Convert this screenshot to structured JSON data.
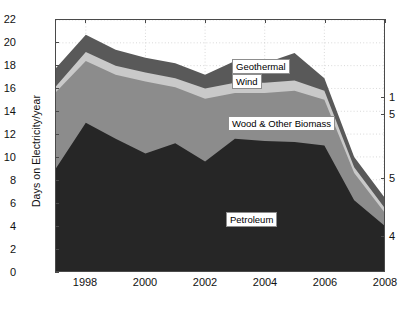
{
  "chart_data": {
    "type": "area",
    "stacked": true,
    "title": "",
    "subtitle": "",
    "xlabel": "",
    "ylabel": "Days on Electricity/year",
    "x": [
      1997,
      1998,
      1999,
      2000,
      2001,
      2002,
      2003,
      2004,
      2005,
      2006,
      2007,
      2008
    ],
    "xlim": [
      1997,
      2008
    ],
    "ylim": [
      0,
      22
    ],
    "ytick_labels": [
      "0",
      "2",
      "4",
      "6",
      "8",
      "10",
      "12",
      "14",
      "16",
      "18",
      "20",
      "22"
    ],
    "ytick_values": [
      0,
      2,
      4,
      6,
      8,
      10,
      12,
      14,
      16,
      18,
      20,
      22
    ],
    "xtick_labels": [
      "1998",
      "2000",
      "2002",
      "2004",
      "2006",
      "2008"
    ],
    "xtick_values": [
      1998,
      2000,
      2002,
      2004,
      2006,
      2008
    ],
    "grid": true,
    "grid_style": "dotted",
    "legend_position": "inline-labels",
    "series": [
      {
        "name": "Petroleum",
        "color": "#262626",
        "values": [
          9.0,
          13.0,
          11.6,
          10.3,
          11.2,
          9.6,
          11.6,
          11.4,
          11.3,
          11.0,
          6.2,
          4.0
        ]
      },
      {
        "name": "Wood & Other Biomass",
        "color": "#8c8c8c",
        "values": [
          6.7,
          5.4,
          5.6,
          6.3,
          4.9,
          5.5,
          4.0,
          4.2,
          4.5,
          4.0,
          2.4,
          1.2
        ]
      },
      {
        "name": "Wind",
        "color": "#c9c9c9",
        "values": [
          0.5,
          0.8,
          0.8,
          0.8,
          0.8,
          0.9,
          0.9,
          0.9,
          0.9,
          0.8,
          0.5,
          0.4
        ]
      },
      {
        "name": "Geothermal",
        "color": "#595959",
        "values": [
          1.6,
          1.5,
          1.4,
          1.3,
          1.3,
          1.2,
          1.9,
          1.7,
          2.4,
          1.1,
          0.9,
          0.9
        ]
      }
    ],
    "totals": [
      17.8,
      20.7,
      19.4,
      18.7,
      18.2,
      17.2,
      18.4,
      18.2,
      19.1,
      16.9,
      10.0,
      6.5
    ],
    "inline_labels": [
      {
        "text": "Geothermal",
        "x_px": 231,
        "y_px": 58
      },
      {
        "text": "Wind",
        "x_px": 231,
        "y_px": 73
      },
      {
        "text": "Wood & Other Biomass",
        "x_px": 227,
        "y_px": 115
      },
      {
        "text": "Petroleum",
        "x_px": 225,
        "y_px": 211
      }
    ],
    "right_edge_annotations": [
      {
        "text": "1",
        "y_px": 97
      },
      {
        "text": "5",
        "y_px": 114
      },
      {
        "text": "5",
        "y_px": 178
      },
      {
        "text": "4",
        "y_px": 236
      }
    ]
  },
  "axes": {
    "y_axis_title": "Days on Electricity/year"
  },
  "colors": {
    "petroleum": "#262626",
    "wood_other_biomass": "#8c8c8c",
    "wind": "#c9c9c9",
    "geothermal": "#595959",
    "axis": "#4a4a4a",
    "grid": "#bfbfbf",
    "background": "#ffffff",
    "text": "#111111"
  }
}
